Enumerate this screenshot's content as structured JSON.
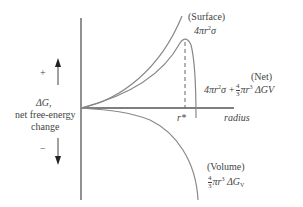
{
  "diagram": {
    "y_axis": {
      "symbol": "ΔG,",
      "label_line1": "net free-energy",
      "label_line2": "change",
      "plus_sign": "+",
      "minus_sign": "−"
    },
    "x_axis": {
      "label": "radius",
      "critical_radius_label": "r*"
    },
    "curves": {
      "surface": {
        "name": "(Surface)",
        "formula_prefix": "4πr",
        "formula_exp": "2",
        "formula_suffix": "σ"
      },
      "net": {
        "name": "(Net)",
        "formula_part1": "4πr",
        "formula_exp1": "2",
        "formula_part2": "σ +",
        "frac_num": "4",
        "frac_den": "3",
        "formula_part3": "πr",
        "formula_exp2": "3",
        "formula_part4": "ΔGV"
      },
      "volume": {
        "name": "(Volume)",
        "frac_num": "4",
        "frac_den": "3",
        "formula_part1": "πr",
        "formula_exp": "3",
        "formula_part2": "ΔG",
        "formula_sub": "V"
      }
    },
    "colors": {
      "curve": "#777777",
      "axis": "#555555"
    }
  }
}
